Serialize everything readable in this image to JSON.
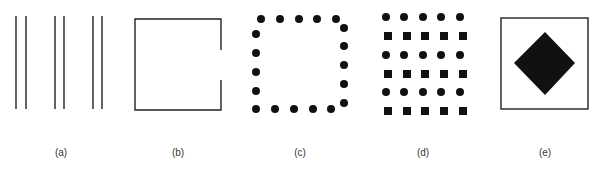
{
  "figure": {
    "panels": [
      {
        "id": "a",
        "label": "(a)",
        "description": "Three pairs of vertical lines (grouping by proximity)"
      },
      {
        "id": "b",
        "label": "(b)",
        "description": "Square outline with gap on right side (closure)"
      },
      {
        "id": "c",
        "label": "(c)",
        "description": "Dots arranged along a square perimeter"
      },
      {
        "id": "d",
        "label": "(d)",
        "description": "Grid with alternating rows of circles and squares (similarity)"
      },
      {
        "id": "e",
        "label": "(e)",
        "description": "Black diamond inside a square frame (figure-ground)"
      }
    ],
    "colors": {
      "stroke": "#222222",
      "fill": "#111111",
      "background": "#ffffff"
    }
  }
}
